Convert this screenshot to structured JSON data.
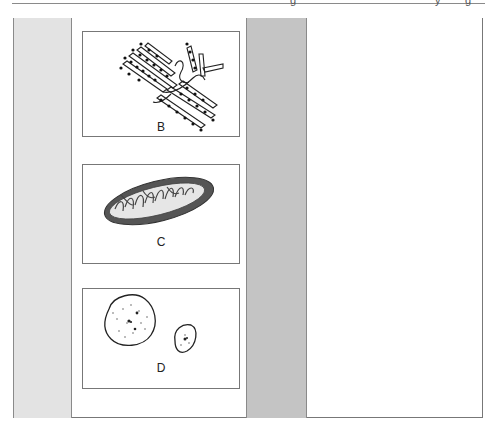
{
  "header": {
    "fragments": [
      "g",
      "y",
      "g"
    ]
  },
  "panels": [
    {
      "id": "B",
      "label": "B",
      "subject": "rough endoplasmic reticulum with ribosomes"
    },
    {
      "id": "C",
      "label": "C",
      "subject": "mitochondrion cross-section"
    },
    {
      "id": "D",
      "label": "D",
      "subject": "vesicles / lysosomes with granular content"
    }
  ],
  "colors": {
    "left_column": "#e3e3e3",
    "middle_column": "#c4c4c4",
    "border": "#777777"
  }
}
